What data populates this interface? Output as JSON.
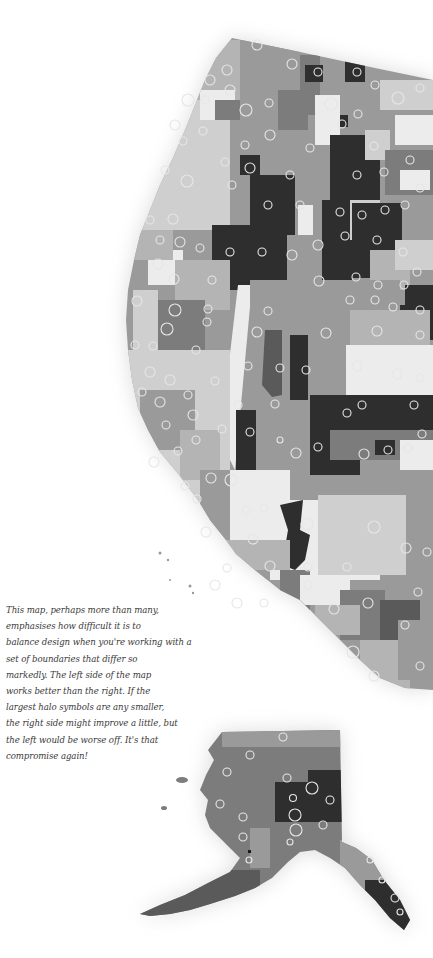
{
  "map": {
    "title": "Western United States and Alaska choropleth with halo symbols",
    "style": "grayscale",
    "colors": {
      "background": "#ffffff",
      "shade_lightest": "#ececec",
      "shade_light": "#cfcfcf",
      "shade_mid_light": "#b4b4b4",
      "shade_mid": "#9a9a9a",
      "shade_mid_dark": "#7c7c7c",
      "shade_dark": "#5a5a5a",
      "shade_darkest": "#2e2e2e",
      "halo_stroke": "#e6e6e6"
    },
    "regions": [
      "Contiguous western US",
      "Alaska"
    ],
    "symbol_type": "halo circles"
  },
  "annotation": {
    "lines": [
      "This map, perhaps more than many,",
      "emphasises how difficult it is to",
      "balance design when you're working with a",
      "set of boundaries that differ so",
      "markedly. The left side of the map",
      "works better than the right. If the",
      "largest halo symbols are any smaller,",
      "the right side might improve a little, but",
      "the left would be worse off. It's that",
      "compromise again!"
    ]
  }
}
